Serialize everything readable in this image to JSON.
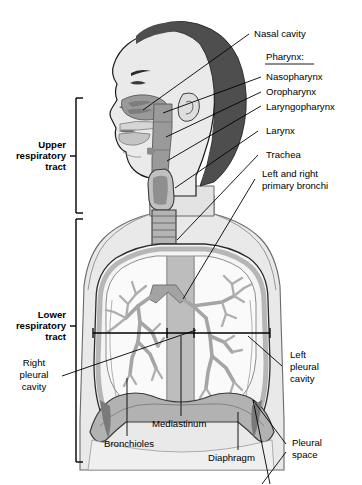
{
  "figure": {
    "type": "anatomical-diagram"
  },
  "brackets": [
    {
      "id": "upper",
      "lines": [
        "Upper",
        "respiratory",
        "tract"
      ]
    },
    {
      "id": "lower",
      "lines": [
        "Lower",
        "respiratory",
        "tract"
      ]
    }
  ],
  "labels": {
    "nasal_cavity": "Nasal cavity",
    "pharynx_heading": "Pharynx:",
    "nasopharynx": "Nasopharynx",
    "oropharynx": "Oropharynx",
    "laryngopharynx": "Laryngopharynx",
    "larynx": "Larynx",
    "trachea": "Trachea",
    "primary_bronchi_line1": "Left and right",
    "primary_bronchi_line2": "primary bronchi",
    "right_pleural_cavity_line1": "Right",
    "right_pleural_cavity_line2": "pleural",
    "right_pleural_cavity_line3": "cavity",
    "left_pleural_cavity_line1": "Left",
    "left_pleural_cavity_line2": "pleural",
    "left_pleural_cavity_line3": "cavity",
    "bronchioles": "Bronchioles",
    "mediastinum": "Mediastinum",
    "diaphragm": "Diaphragm",
    "pleural_space_line1": "Pleural",
    "pleural_space_line2": "space"
  },
  "colors": {
    "background": "#ffffff",
    "outline": "#1a1a1a",
    "hair": "#4e4e4e",
    "skin": "#e6e6e6",
    "skin_shadow": "#d2d2d2",
    "airway": "#9a9a9a",
    "airway_dark": "#808080",
    "lung_field": "#f2f2f2",
    "pleura": "#c9c9c9",
    "diaphragm": "#b0b0b0",
    "bronchial_tree": "#a8a8a8",
    "leader_line": "#000000",
    "text": "#000000"
  }
}
